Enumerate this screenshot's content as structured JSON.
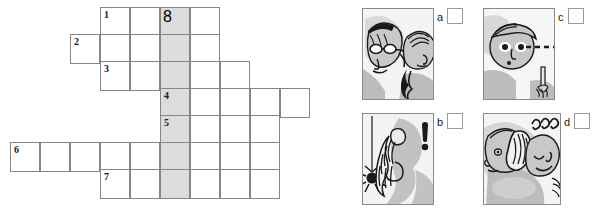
{
  "crossword": {
    "name": "crossword-puzzle-grid",
    "cell_size": 30,
    "shaded_column_index": 5,
    "shaded_color": "#dcdcdc",
    "border_color": "#868686",
    "rows": [
      {
        "clue_number": "1",
        "top": 7,
        "left": 100,
        "cells": 4,
        "number_cell": 0,
        "shaded_cells": [
          2
        ]
      },
      {
        "clue_number": "2",
        "top": 34,
        "left": 70,
        "cells": 5,
        "number_cell": 0,
        "shaded_cells": [
          3
        ]
      },
      {
        "clue_number": "3",
        "top": 61,
        "left": 100,
        "cells": 5,
        "number_cell": 0,
        "shaded_cells": [
          2
        ]
      },
      {
        "clue_number": "4",
        "top": 88,
        "left": 160,
        "cells": 5,
        "number_cell": 0,
        "shaded_cells": [
          0
        ]
      },
      {
        "clue_number": "5",
        "top": 115,
        "left": 160,
        "cells": 4,
        "number_cell": 0,
        "shaded_cells": [
          0
        ]
      },
      {
        "clue_number": "6",
        "top": 142,
        "left": 10,
        "cells": 9,
        "number_cell": 0,
        "shaded_cells": [
          5
        ]
      },
      {
        "clue_number": "7",
        "top": 169,
        "left": 100,
        "cells": 6,
        "number_cell": 0,
        "shaded_cells": [
          2
        ]
      }
    ],
    "vertical_highlight": {
      "label": "8",
      "left": 160,
      "top": 7,
      "width": 30,
      "height": 189
    }
  },
  "panels": [
    {
      "id": "panel-a",
      "letter": "a",
      "icon_name": "illustration-person-whispering",
      "description": "Person with glasses whispering into another person's ear",
      "pic": {
        "left": 362,
        "top": 8,
        "width": 72,
        "height": 92
      },
      "letter_pos": {
        "left": 437,
        "top": 10
      },
      "checkbox_pos": {
        "left": 447,
        "top": 8
      }
    },
    {
      "id": "panel-c",
      "letter": "c",
      "icon_name": "illustration-person-staring",
      "description": "Person staring with dashed line of sight toward a pencil",
      "pic": {
        "left": 483,
        "top": 8,
        "width": 72,
        "height": 92
      },
      "letter_pos": {
        "left": 558,
        "top": 10
      },
      "checkbox_pos": {
        "left": 568,
        "top": 8
      }
    },
    {
      "id": "panel-b",
      "letter": "b",
      "icon_name": "illustration-spider-scare",
      "description": "Long-haired person startled by a spider hanging on a thread, exclamation mark",
      "pic": {
        "left": 362,
        "top": 113,
        "width": 72,
        "height": 92
      },
      "letter_pos": {
        "left": 437,
        "top": 115
      },
      "checkbox_pos": {
        "left": 447,
        "top": 113
      }
    },
    {
      "id": "panel-d",
      "letter": "d",
      "icon_name": "illustration-two-people-laughing",
      "description": "Two people close together, curly sound marks above",
      "pic": {
        "left": 483,
        "top": 113,
        "width": 78,
        "height": 92
      },
      "letter_pos": {
        "left": 564,
        "top": 115
      },
      "checkbox_pos": {
        "left": 574,
        "top": 113
      }
    }
  ],
  "colors": {
    "grid_line": "#868686",
    "shade": "#dcdcdc",
    "ink": "#1a1a1a",
    "illustration_gray": "#b8b8b8",
    "illustration_light": "#d8d8d8",
    "panel_bg": "#f2f2f2"
  }
}
